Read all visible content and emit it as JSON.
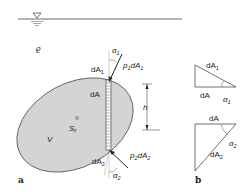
{
  "figure": {
    "panel_a": {
      "label": "a",
      "fluid_symbol": "ϱ",
      "volume_label": "V",
      "centroid_label": "S",
      "centroid_sub": "f",
      "height_label": "h",
      "top": {
        "area": "dA",
        "area_sub": "1",
        "angle": "α",
        "angle_sub": "1",
        "force_p": "p",
        "force_p_sub": "1",
        "force_dA": "dA",
        "force_dA_sub": "1"
      },
      "bottom": {
        "area": "dA",
        "area_sub": "2",
        "angle": "α",
        "angle_sub": "2",
        "force_p": "p",
        "force_p_sub": "2",
        "force_dA": "dA",
        "force_dA_sub": "2"
      },
      "mid_area": "dA"
    },
    "panel_b": {
      "label": "b",
      "upper": {
        "hyp": "dA",
        "hyp_sub": "1",
        "base": "dA",
        "angle": "α",
        "angle_sub": "1"
      },
      "lower": {
        "top": "dA",
        "hyp": "dA",
        "hyp_sub": "2",
        "angle": "α",
        "angle_sub": "2"
      }
    },
    "colors": {
      "body_fill": "#d4d4d4",
      "stroke": "#333333"
    }
  }
}
